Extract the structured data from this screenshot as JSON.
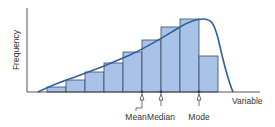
{
  "chart_data": {
    "type": "bar",
    "title": "",
    "xlabel": "Variable",
    "ylabel": "Frequency",
    "categories": [
      "1",
      "2",
      "3",
      "4",
      "5",
      "6",
      "7",
      "8",
      "9"
    ],
    "values": [
      5,
      12,
      20,
      29,
      40,
      52,
      65,
      73,
      36
    ],
    "overlay": {
      "type": "line",
      "name": "smoothed distribution curve (negatively skewed)"
    },
    "annotations": [
      {
        "label": "Mean",
        "bar_position": 5.0
      },
      {
        "label": "Median",
        "bar_position": 6.0
      },
      {
        "label": "Mode",
        "bar_position": 8.0
      }
    ],
    "grid": false,
    "legend": "none",
    "colors": {
      "bar_fill": "#a9c3e8",
      "bar_stroke": "#3a4a60",
      "curve": "#2f5fa0",
      "axis": "#444444",
      "marker": "#1f3f7a"
    }
  },
  "labels": {
    "ylabel": "Frequency",
    "xlabel": "Variable",
    "mean": "Mean",
    "median": "Median",
    "mode": "Mode"
  }
}
